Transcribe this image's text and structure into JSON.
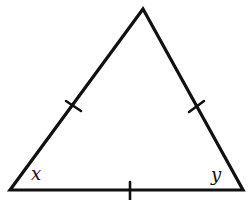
{
  "diagram": {
    "type": "isosceles/equilateral triangle with congruence tick marks",
    "stroke_color": "#111111",
    "background_color": "#ffffff",
    "vertices": {
      "apex": [
        143,
        9
      ],
      "bottom_left": [
        10,
        190
      ],
      "bottom_right": [
        243,
        190
      ]
    },
    "tick_marks": [
      {
        "side": "left",
        "center": [
          73,
          106
        ]
      },
      {
        "side": "right",
        "center": [
          197,
          106
        ]
      },
      {
        "side": "base",
        "center": [
          130,
          190
        ]
      }
    ],
    "angle_labels": {
      "bottom_left": "x",
      "bottom_right": "y"
    }
  }
}
